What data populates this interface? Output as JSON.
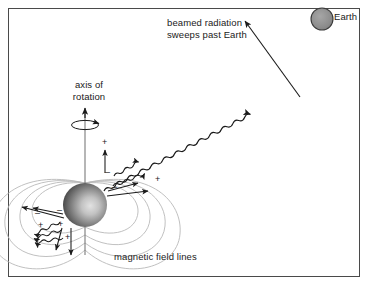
{
  "figure": {
    "type": "astronomy-diagram",
    "background_color": "#ffffff",
    "border_color": "#4a4a4a"
  },
  "labels": {
    "axis_of_rotation_line1": "axis of",
    "axis_of_rotation_line2": "rotation",
    "beamed_radiation_line1": "beamed radiation",
    "beamed_radiation_line2": "sweeps past Earth",
    "earth": "Earth",
    "magnetic_field_lines": "magnetic field lines"
  },
  "objects": {
    "neutron_star": {
      "name": "neutron star",
      "center_x": 85,
      "center_y": 205,
      "radius": 22,
      "fill_dark": "#4d4d4d",
      "fill_light": "#d8d8d8"
    },
    "earth": {
      "name": "Earth",
      "center_x": 322,
      "center_y": 19,
      "radius": 11,
      "fill": "#8c8c8c",
      "stroke": "#3a3a3a"
    }
  },
  "charges": {
    "plus_symbol": "+",
    "minus_symbol": "–",
    "upper_right_plus_count": 2,
    "upper_right_minus_count": 2,
    "lower_left_plus_count": 3,
    "lower_left_minus_count": 2
  },
  "colors": {
    "field_line": "#b9b9b9",
    "ink": "#1a1a1a",
    "axis_line": "#7a7a7a"
  }
}
